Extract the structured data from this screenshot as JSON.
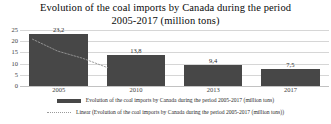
{
  "chart_data": {
    "type": "bar",
    "title": "Evolution of the coal imports by Canada during the period 2005-2017 (million tons)",
    "title_line1": "Evolution of the coal imports by Canada during the period",
    "title_line2": "2005-2017 (million tons)",
    "categories": [
      "2005",
      "2010",
      "2013",
      "2017"
    ],
    "values": [
      23.2,
      13.8,
      9.4,
      7.5
    ],
    "value_labels": [
      "23,2",
      "13,8",
      "9,4",
      "7,5"
    ],
    "xlabel": "",
    "ylabel": "",
    "ylim": [
      0,
      25
    ],
    "yticks": [
      25,
      20,
      15,
      10,
      5,
      0
    ],
    "ytick_labels": [
      "25",
      "20",
      "15",
      "10",
      "5",
      "0"
    ],
    "grid": true,
    "legend_position": "bottom",
    "series": [
      {
        "name": "Evolution of the coal imports by Canada during the period 2005-2017 (million tons)",
        "type": "bar",
        "color": "#474747",
        "values": [
          23.2,
          13.8,
          9.4,
          7.5
        ]
      },
      {
        "name": "Linear (Evolution of the coal imports by Canada during the period 2005-2017 (million tons))",
        "type": "trendline",
        "style": "dotted",
        "color": "#9a9a9a",
        "values": [
          20.9,
          15.6,
          12.4,
          8.2
        ]
      }
    ]
  },
  "legend": {
    "entries": [
      {
        "label": "Evolution of the coal imports by Canada during the period 2005-2017 (million tons)",
        "swatch": "solid-bar-swatch"
      },
      {
        "label": "Linear (Evolution of the coal imports by Canada during the period 2005-2017 (million tons))",
        "swatch": "dotted-line-swatch"
      }
    ]
  },
  "colors": {
    "bar": "#474747",
    "trendline": "#9a9a9a",
    "gridline": "#d6d6d6",
    "text": "#2b2b2b",
    "background": "#ffffff"
  }
}
